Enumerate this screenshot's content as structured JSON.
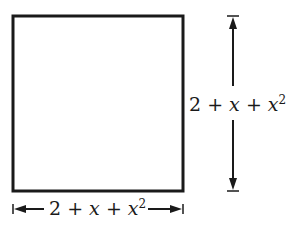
{
  "diagram": {
    "shape": "square",
    "side_label": {
      "constant": "2",
      "op1": "+",
      "term1": "x",
      "op2": "+",
      "term2": "x",
      "term2_exp": "2"
    },
    "height_label": {
      "constant": "2",
      "op1": "+",
      "term1": "x",
      "op2": "+",
      "term2": "x",
      "term2_exp": "2"
    },
    "stroke_color": "#1a1a1a"
  }
}
